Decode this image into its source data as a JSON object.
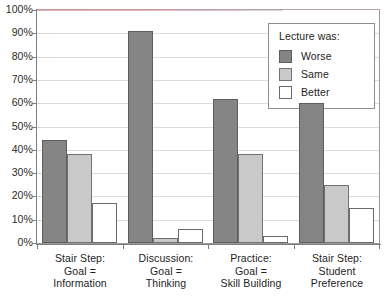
{
  "chart_data": {
    "type": "bar",
    "title": "",
    "xlabel": "",
    "ylabel": "",
    "ylim": [
      0,
      100
    ],
    "y_tick_labels": [
      "100%",
      "90%",
      "80%",
      "70%",
      "60%",
      "50%",
      "40%",
      "30%",
      "20%",
      "10%",
      "0%"
    ],
    "y_tick_values": [
      100,
      90,
      80,
      70,
      60,
      50,
      40,
      30,
      20,
      10,
      0
    ],
    "grid": true,
    "legend_position": "upper-right-inside",
    "legend_title": "Lecture was:",
    "categories": [
      "Stair Step:\nGoal =\nInformation",
      "Discussion:\nGoal =\nThinking",
      "Practice:\nGoal =\nSkill Building",
      "Stair Step:\nStudent\nPreference"
    ],
    "category_lines": [
      [
        "Stair Step:",
        "Goal =",
        "Information"
      ],
      [
        "Discussion:",
        "Goal =",
        "Thinking"
      ],
      [
        "Practice:",
        "Goal =",
        "Skill Building"
      ],
      [
        "Stair Step:",
        "Student",
        "Preference"
      ]
    ],
    "series": [
      {
        "name": "Worse",
        "color": "#858585",
        "values": [
          44,
          91,
          62,
          60
        ]
      },
      {
        "name": "Same",
        "color": "#c9c9c9",
        "values": [
          38,
          2,
          38,
          25
        ]
      },
      {
        "name": "Better",
        "color": "#ffffff",
        "values": [
          17,
          6,
          3,
          15
        ]
      }
    ]
  },
  "legend": {
    "title": "Lecture was:",
    "items": [
      {
        "label": "Worse",
        "swatch": "worse"
      },
      {
        "label": "Same",
        "swatch": "same"
      },
      {
        "label": "Better",
        "swatch": "better"
      }
    ]
  }
}
